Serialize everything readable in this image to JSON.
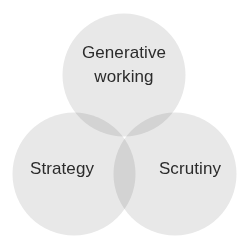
{
  "diagram": {
    "type": "venn",
    "title": "",
    "background_color": "#ffffff",
    "canvas": {
      "width": 249,
      "height": 247
    },
    "circle_fill_color": "#e8e8e8",
    "overlap_two_color": "#c8c8c8",
    "overlap_three_color": "#a8a8a8",
    "label_color": "#2b2b2b",
    "sets": [
      {
        "id": "generative-working",
        "label": "Generative\nworking",
        "label_line_1": "Generative",
        "label_line_2": "working",
        "position": "top",
        "cx": 124,
        "cy": 75,
        "r": 61.5,
        "fill": "#e8e8e8",
        "label_x": 124,
        "label_y": 65
      },
      {
        "id": "strategy",
        "label": "Strategy",
        "position": "bottom-left",
        "cx": 74,
        "cy": 174,
        "r": 61.5,
        "fill": "#e8e8e8",
        "label_x": 62,
        "label_y": 169
      },
      {
        "id": "scrutiny",
        "label": "Scrutiny",
        "position": "bottom-right",
        "cx": 175,
        "cy": 174,
        "r": 61.5,
        "fill": "#e8e8e8",
        "label_x": 190,
        "label_y": 169
      }
    ]
  }
}
